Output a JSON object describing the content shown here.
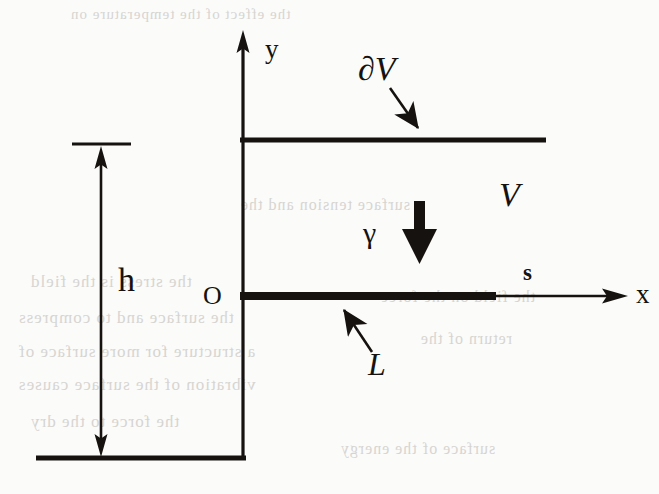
{
  "figure": {
    "kind": "line-diagram",
    "background_color": "#fbfbfa",
    "ink_color": "#15120f",
    "ghost_color": "#b9b6b0"
  },
  "labels": {
    "y_axis": "y",
    "x_axis": "x",
    "origin": "O",
    "height": "h",
    "boundary": "∂V",
    "volume": "V",
    "crack": "L",
    "surface_tension": "γ",
    "arc_length": "s"
  },
  "icons": {
    "y_axis_arrow": "arrow-up-icon",
    "x_axis_arrow": "arrow-right-icon",
    "height_dimension_arrow": "double-arrow-vertical-icon",
    "boundary_pointer_arrow": "arrow-down-right-icon",
    "crack_pointer_arrow": "arrow-up-left-icon",
    "gamma_arrow": "thick-arrow-down-icon"
  },
  "geometry": {
    "y_axis": {
      "x": 243,
      "y_top": 33,
      "y_bottom": 460
    },
    "x_axis": {
      "y": 296,
      "x_start": 243,
      "x_end": 628
    },
    "top_boundary": {
      "y": 140,
      "x_start": 240,
      "x_end": 546
    },
    "bottom_boundary": {
      "y": 458,
      "x_start": 36,
      "x_end": 246
    },
    "crack_line": {
      "y": 296,
      "x_start": 240,
      "x_end": 496,
      "thickness": 7
    },
    "height_dimension": {
      "x": 101,
      "y_top": 146,
      "y_bottom": 457
    },
    "height_tick": {
      "y": 144,
      "x_start": 72,
      "x_end": 131
    },
    "gamma_arrow": {
      "x": 420,
      "y_top": 203,
      "y_bottom": 258
    },
    "boundary_arrow": {
      "x1": 390,
      "y1": 88,
      "x2": 424,
      "y2": 136
    },
    "crack_arrow": {
      "x1": 372,
      "y1": 352,
      "x2": 340,
      "y2": 304
    }
  },
  "label_positions": {
    "y_axis": {
      "x": 265,
      "y": 36
    },
    "x_axis": {
      "x": 636,
      "y": 281
    },
    "origin": {
      "x": 203,
      "y": 283
    },
    "height": {
      "x": 118,
      "y": 263
    },
    "boundary": {
      "x": 358,
      "y": 52
    },
    "volume": {
      "x": 499,
      "y": 178
    },
    "crack": {
      "x": 368,
      "y": 348
    },
    "surface_tension": {
      "x": 363,
      "y": 218
    },
    "arc_length": {
      "x": 523,
      "y": 261
    }
  },
  "ghost_text": {
    "note": "faint mirrored show-through from reverse printed page",
    "lines": [
      {
        "text": "the effect of the temperature on",
        "x": 70,
        "y": 6,
        "size": 15
      },
      {
        "text": "surface tension and the",
        "x": 240,
        "y": 196,
        "size": 16
      },
      {
        "text": "the stress is the field",
        "x": 30,
        "y": 272,
        "size": 17
      },
      {
        "text": "the surface and to compress",
        "x": 18,
        "y": 308,
        "size": 17
      },
      {
        "text": "a structure for more surface of",
        "x": 18,
        "y": 342,
        "size": 17
      },
      {
        "text": "vibration of the surface causes",
        "x": 18,
        "y": 375,
        "size": 17
      },
      {
        "text": "the force to the dry",
        "x": 30,
        "y": 412,
        "size": 17
      },
      {
        "text": "surface of the energy",
        "x": 340,
        "y": 440,
        "size": 16
      },
      {
        "text": "the field on the force",
        "x": 380,
        "y": 288,
        "size": 16
      },
      {
        "text": "return of the",
        "x": 420,
        "y": 330,
        "size": 16
      }
    ]
  }
}
